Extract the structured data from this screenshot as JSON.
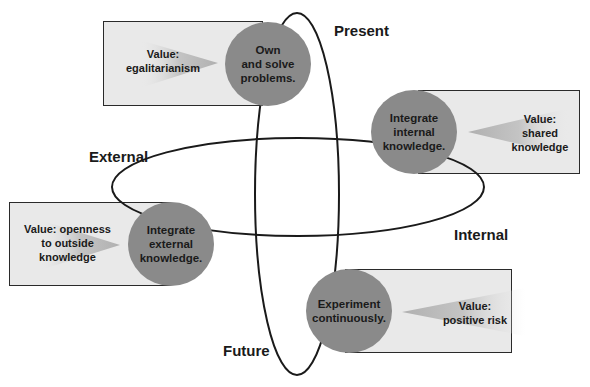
{
  "axes": {
    "present": "Present",
    "future": "Future",
    "external": "External",
    "internal": "Internal"
  },
  "nodes": [
    {
      "id": "own-solve",
      "circle": "Own\nand solve\nproblems.",
      "value": "Value:\negalitarianism"
    },
    {
      "id": "integrate-internal",
      "circle": "Integrate\ninternal\nknowledge.",
      "value": "Value:\nshared\nknowledge"
    },
    {
      "id": "integrate-external",
      "circle": "Integrate\nexternal\nknowledge.",
      "value": "Value: openness\nto outside\nknowledge"
    },
    {
      "id": "experiment",
      "circle": "Experiment\ncontinuously.",
      "value": "Value:\npositive risk"
    }
  ],
  "colors": {
    "circle_fill": "#8a8a8a",
    "box_fill": "#e9e9e9",
    "arrow_fill": "#bdbdbd",
    "line": "#1a1a1a"
  }
}
